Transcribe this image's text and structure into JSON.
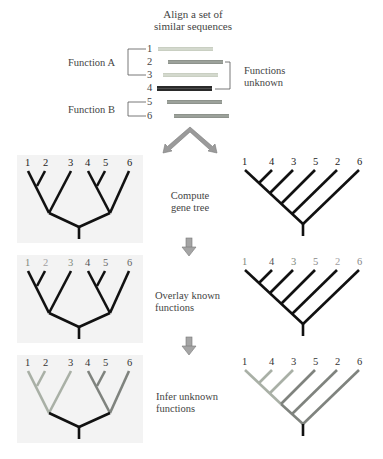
{
  "title": {
    "line1": "Align a set of",
    "line2": "similar sequences"
  },
  "alignment": {
    "function_a_label": "Function A",
    "function_b_label": "Function B",
    "unknown_label_line1": "Functions",
    "unknown_label_line2": "unknown",
    "sequences": [
      {
        "id": "1",
        "color": "#c9cfc2"
      },
      {
        "id": "2",
        "color": "#8e938c"
      },
      {
        "id": "3",
        "color": "#c9cfc2"
      },
      {
        "id": "4",
        "color": "#2a2a2a"
      },
      {
        "id": "5",
        "color": "#8e938c"
      },
      {
        "id": "6",
        "color": "#8e938c"
      }
    ]
  },
  "steps": {
    "step1_line1": "Compute",
    "step1_line2": "gene tree",
    "step2_line1": "Overlay known",
    "step2_line2": "functions",
    "step3_line1": "Infer unknown",
    "step3_line2": "functions"
  },
  "left_tree": {
    "leaf_order": [
      "1",
      "2",
      "3",
      "4",
      "5",
      "6"
    ]
  },
  "right_tree": {
    "leaf_order": [
      "1",
      "4",
      "3",
      "5",
      "2",
      "6"
    ]
  },
  "colors": {
    "function_a": "#a9b0a6",
    "function_b": "#7f837e",
    "unknown": "#222222",
    "arrow": "#9a9a9a",
    "panel_bg": "#f3f3f3"
  }
}
